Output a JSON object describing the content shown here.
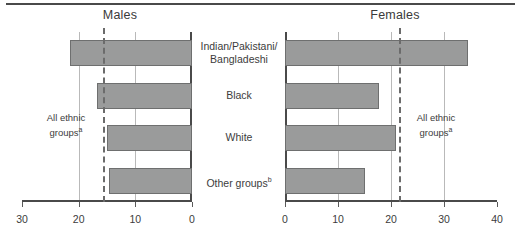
{
  "figure": {
    "panels": [
      {
        "key": "males",
        "title": "Males"
      },
      {
        "key": "females",
        "title": "Females"
      }
    ],
    "reference_label_line1": "All ethnic",
    "reference_label_line2": "groups",
    "reference_label_marker": "a"
  },
  "chart_data": {
    "type": "bar",
    "orientation": "horizontal",
    "title": "",
    "xlabel": "",
    "ylabel": "",
    "grid": true,
    "legend_position": "none",
    "categories": [
      "Indian/Pakistani/Bangladeshi",
      "Black",
      "White",
      "Other groups"
    ],
    "category_labels": [
      {
        "line1": "Indian/Pakistani/",
        "line2": "Bangladeshi",
        "marker": ""
      },
      {
        "line1": "Black",
        "line2": "",
        "marker": ""
      },
      {
        "line1": "White",
        "line2": "",
        "marker": ""
      },
      {
        "line1": "Other groups",
        "line2": "",
        "marker": "b"
      }
    ],
    "series": [
      {
        "name": "Males",
        "values": [
          21.5,
          16.8,
          15.0,
          14.6
        ],
        "axis_reversed": true,
        "xlim": [
          0,
          30
        ],
        "ticks": [
          30,
          20,
          10,
          0
        ],
        "reference_value": 15.7
      },
      {
        "name": "Females",
        "values": [
          34.5,
          17.7,
          21.0,
          15.0
        ],
        "axis_reversed": false,
        "xlim": [
          0,
          40
        ],
        "ticks": [
          0,
          10,
          20,
          30,
          40
        ],
        "reference_value": 21.5
      }
    ],
    "colors": {
      "bar_fill": "#9a9b9b",
      "bar_stroke": "#6e6f6f",
      "gridline": "#b9b9b9",
      "axis": "#4a4a4a",
      "reference_line": "#6b6b6b",
      "text": "#3c3c3c"
    }
  }
}
